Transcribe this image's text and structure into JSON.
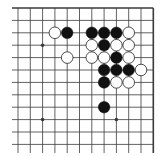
{
  "board": {
    "description": "Go board diagram (upper-right corner region)",
    "columns": 12,
    "rows": 12,
    "origin_x": 18,
    "origin_y": 8,
    "spacing_x": 12.3,
    "spacing_y": 12.4,
    "edges": {
      "top": true,
      "right": true,
      "left": false,
      "bottom": false
    },
    "colors": {
      "line": "#3a3a3a",
      "black_stone": "#111111",
      "white_stone": "#ffffff",
      "white_outline": "#222222",
      "background": "#ffffff"
    },
    "star_points": [
      {
        "col": 2,
        "row": 3
      },
      {
        "col": 2,
        "row": 9
      },
      {
        "col": 8,
        "row": 9
      }
    ],
    "stones": [
      {
        "color": "white",
        "col": 3,
        "row": 2
      },
      {
        "color": "black",
        "col": 4,
        "row": 2
      },
      {
        "color": "black",
        "col": 6,
        "row": 2
      },
      {
        "color": "black",
        "col": 7,
        "row": 2
      },
      {
        "color": "black",
        "col": 8,
        "row": 2
      },
      {
        "color": "white",
        "col": 9,
        "row": 2
      },
      {
        "color": "white",
        "col": 6,
        "row": 3
      },
      {
        "color": "black",
        "col": 7,
        "row": 3
      },
      {
        "color": "white",
        "col": 8,
        "row": 3
      },
      {
        "color": "white",
        "col": 9,
        "row": 3
      },
      {
        "color": "white",
        "col": 4,
        "row": 4
      },
      {
        "color": "white",
        "col": 6,
        "row": 4
      },
      {
        "color": "white",
        "col": 7,
        "row": 4
      },
      {
        "color": "black",
        "col": 8,
        "row": 4
      },
      {
        "color": "white",
        "col": 9,
        "row": 4
      },
      {
        "color": "black",
        "col": 7,
        "row": 5
      },
      {
        "color": "black",
        "col": 8,
        "row": 5
      },
      {
        "color": "black",
        "col": 9,
        "row": 5
      },
      {
        "color": "white",
        "col": 10,
        "row": 5
      },
      {
        "color": "black",
        "col": 7,
        "row": 6
      },
      {
        "color": "white",
        "col": 8,
        "row": 6
      },
      {
        "color": "white",
        "col": 9,
        "row": 6
      },
      {
        "color": "black",
        "col": 7,
        "row": 8
      }
    ]
  }
}
